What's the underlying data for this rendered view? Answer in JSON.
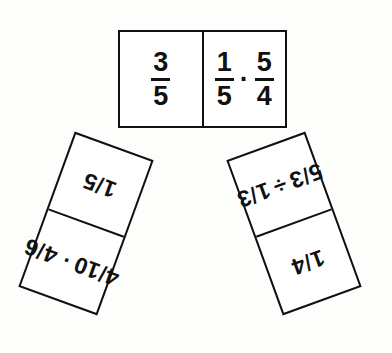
{
  "figure": {
    "background_color": "#fdfdfb",
    "ink_color": "#111111",
    "tile_fill": "#ffffff"
  },
  "symbols": {
    "multiply": "·",
    "divide": "÷",
    "slash": "/"
  },
  "tiles": [
    {
      "id": "tile-top",
      "position": "top",
      "orientation": "horizontal",
      "rotation_degrees": 0,
      "cells": [
        {
          "id": "top-left-cell",
          "kind": "answer",
          "style": "stacked",
          "text": "3/5",
          "terms": [
            {
              "numerator": "3",
              "denominator": "5"
            }
          ],
          "operator": ""
        },
        {
          "id": "top-right-cell",
          "kind": "expression",
          "style": "stacked",
          "text": "1/5 · 5/4",
          "terms": [
            {
              "numerator": "1",
              "denominator": "5"
            },
            {
              "numerator": "5",
              "denominator": "4"
            }
          ],
          "operator": "·"
        }
      ]
    },
    {
      "id": "tile-left",
      "position": "lower-left",
      "orientation": "vertical",
      "rotation_degrees": 200,
      "cells": [
        {
          "id": "left-upper-cell",
          "kind": "expression",
          "style": "slash",
          "text": "4/10 · 4/6",
          "terms": [
            {
              "numerator": "4",
              "denominator": "10"
            },
            {
              "numerator": "4",
              "denominator": "6"
            }
          ],
          "operator": "·"
        },
        {
          "id": "left-lower-cell",
          "kind": "answer",
          "style": "slash",
          "text": "1/5",
          "terms": [
            {
              "numerator": "1",
              "denominator": "5"
            }
          ],
          "operator": ""
        }
      ]
    },
    {
      "id": "tile-right",
      "position": "lower-right",
      "orientation": "vertical",
      "rotation_degrees": 160,
      "cells": [
        {
          "id": "right-upper-cell",
          "kind": "answer",
          "style": "slash",
          "text": "1/4",
          "terms": [
            {
              "numerator": "1",
              "denominator": "4"
            }
          ],
          "operator": ""
        },
        {
          "id": "right-lower-cell",
          "kind": "expression",
          "style": "slash",
          "text": "5/3 ÷ 1/3",
          "terms": [
            {
              "numerator": "5",
              "denominator": "3"
            },
            {
              "numerator": "1",
              "denominator": "3"
            }
          ],
          "operator": "÷"
        }
      ]
    }
  ]
}
